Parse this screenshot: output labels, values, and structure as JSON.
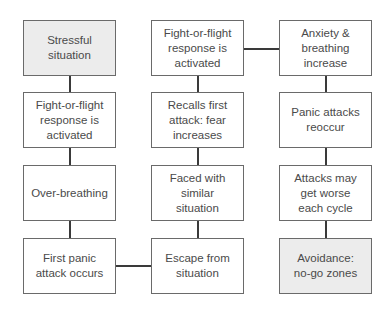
{
  "diagram": {
    "type": "flowchart",
    "colors": {
      "border": "#6a6a6a",
      "shaded_fill": "#ececec",
      "fill": "#ffffff",
      "connector": "#3a3a3a",
      "text": "#4a4a4a"
    },
    "columns": [
      {
        "boxes": [
          {
            "label": "Stressful\nsituation",
            "shaded": true
          },
          {
            "label": "Fight-or-flight\nresponse is\nactivated",
            "shaded": false
          },
          {
            "label": "Over-breathing",
            "shaded": false
          },
          {
            "label": "First panic\nattack occurs",
            "shaded": false
          }
        ]
      },
      {
        "boxes": [
          {
            "label": "Fight-or-flight\nresponse is\nactivated",
            "shaded": false
          },
          {
            "label": "Recalls first\nattack: fear\nincreases",
            "shaded": false
          },
          {
            "label": "Faced with\nsimilar\nsituation",
            "shaded": false
          },
          {
            "label": "Escape from\nsituation",
            "shaded": false
          }
        ]
      },
      {
        "boxes": [
          {
            "label": "Anxiety &\nbreathing\nincrease",
            "shaded": false
          },
          {
            "label": "Panic attacks\nreoccur",
            "shaded": false
          },
          {
            "label": "Attacks may\nget worse\neach cycle",
            "shaded": false
          },
          {
            "label": "Avoidance:\nno-go zones",
            "shaded": true
          }
        ]
      }
    ]
  }
}
